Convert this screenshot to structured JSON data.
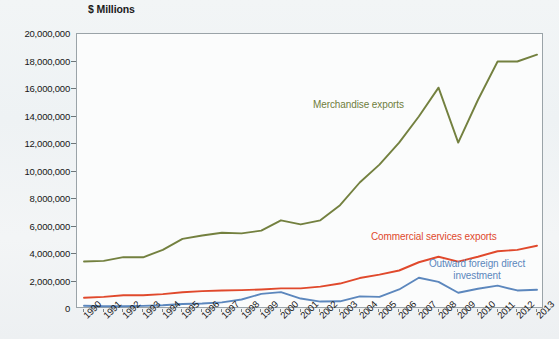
{
  "chart_data": {
    "type": "line",
    "title": "",
    "ylabel": "$ Millions",
    "xlabel": "",
    "ylim": [
      0,
      20000000
    ],
    "ytick_step": 2000000,
    "grid": false,
    "legend_position": "inline-annotations",
    "ytick_labels": [
      "20,000,000",
      "18,000,000",
      "16,000,000",
      "14,000,000",
      "12,000,000",
      "10,000,000",
      "8,000,000",
      "6,000,000",
      "4,000,000",
      "2,000,000",
      "0"
    ],
    "ytick_values": [
      20000000,
      18000000,
      16000000,
      14000000,
      12000000,
      10000000,
      8000000,
      6000000,
      4000000,
      2000000,
      0
    ],
    "categories": [
      "1990",
      "1991",
      "1992",
      "1993",
      "1994",
      "1995",
      "1996",
      "1997",
      "1998",
      "1999",
      "2000",
      "2001",
      "2002",
      "2003",
      "2004",
      "2005",
      "2006",
      "2007",
      "2008",
      "2009",
      "2010",
      "2011",
      "2012",
      "2013"
    ],
    "series": [
      {
        "name": "Merchandise exports",
        "color": "#73803f",
        "values": [
          3450000,
          3500000,
          3770000,
          3760000,
          4300000,
          5100000,
          5350000,
          5550000,
          5500000,
          5700000,
          6450000,
          6150000,
          6450000,
          7550000,
          9200000,
          10500000,
          12100000,
          14000000,
          16100000,
          12100000,
          15200000,
          18000000,
          18000000,
          18500000
        ]
      },
      {
        "name": "Commercial services exports",
        "color": "#e0492c",
        "values": [
          820000,
          880000,
          1000000,
          1000000,
          1080000,
          1220000,
          1300000,
          1350000,
          1370000,
          1420000,
          1500000,
          1500000,
          1630000,
          1850000,
          2250000,
          2500000,
          2800000,
          3400000,
          3800000,
          3450000,
          3800000,
          4200000,
          4300000,
          4600000
        ]
      },
      {
        "name": "Outward foreign direct investment",
        "color": "#5c87bd",
        "values": [
          240000,
          200000,
          200000,
          230000,
          270000,
          360000,
          400000,
          480000,
          690000,
          1100000,
          1230000,
          760000,
          540000,
          560000,
          920000,
          880000,
          1420000,
          2270000,
          1970000,
          1180000,
          1470000,
          1700000,
          1350000,
          1400000
        ]
      }
    ],
    "annotations": [
      {
        "text": "Merchandise exports",
        "series": "Merchandise exports"
      },
      {
        "text": "Commercial services exports",
        "series": "Commercial services exports"
      },
      {
        "text": "Outward foreign direct",
        "series": "Outward foreign direct investment"
      },
      {
        "text": "investment",
        "series": "Outward foreign direct investment"
      }
    ]
  },
  "labels": {
    "y_axis_title": "$ Millions",
    "merchandise_exports": "Merchandise exports",
    "commercial_services_exports": "Commercial services exports",
    "outward_fdi_line1": "Outward foreign direct",
    "outward_fdi_line2": "investment"
  }
}
